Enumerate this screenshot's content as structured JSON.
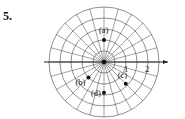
{
  "problem_number": "5.",
  "diagram": {
    "type": "polar-grid",
    "rings": [
      0.5,
      1,
      1.5,
      2,
      2.5
    ],
    "spoke_step_deg": 15,
    "axis_labels": [
      "1",
      "2"
    ],
    "points": [
      {
        "label": "(a)",
        "r": 1,
        "theta_deg": 90
      },
      {
        "label": "(b)",
        "r": 1,
        "theta_deg": 225
      },
      {
        "label": "(c)",
        "r": 1.4,
        "theta_deg": -45
      },
      {
        "label": "(d)",
        "r": 1.4,
        "theta_deg": -90
      }
    ]
  }
}
